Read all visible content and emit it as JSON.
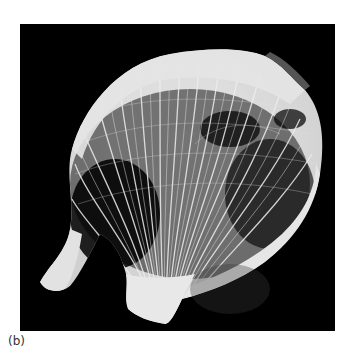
{
  "figure": {
    "label": "(b)",
    "colors": {
      "background": "#000000",
      "bone": "#e6e6e6",
      "page": "#ffffff",
      "caption": "#333333"
    }
  }
}
